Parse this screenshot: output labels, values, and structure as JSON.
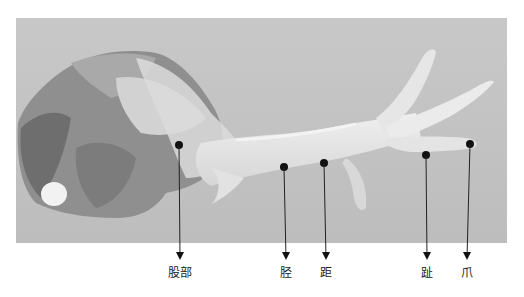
{
  "figure": {
    "background_color": "#c2c2c2",
    "labels": [
      {
        "id": "thigh",
        "text": "股部",
        "dot_x": 179,
        "dot_y": 145,
        "label_x": 180
      },
      {
        "id": "shank",
        "text": "胫",
        "dot_x": 284,
        "dot_y": 167,
        "label_x": 286
      },
      {
        "id": "spur",
        "text": "距",
        "dot_x": 324,
        "dot_y": 163,
        "label_x": 326
      },
      {
        "id": "toe",
        "text": "趾",
        "dot_x": 426,
        "dot_y": 155,
        "label_x": 427
      },
      {
        "id": "claw",
        "text": "爪",
        "dot_x": 470,
        "dot_y": 144,
        "label_x": 467
      }
    ]
  }
}
